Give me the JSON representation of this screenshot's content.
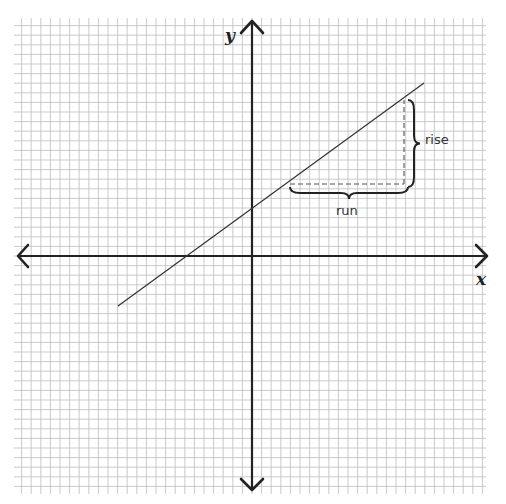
{
  "figure": {
    "title": "",
    "colors": {
      "background": "#ffffff",
      "grid_line": "#bdbdbd",
      "axis": "#222222",
      "line": "#333333",
      "dashed": "#555555",
      "brace": "#222222",
      "text": "#333333"
    },
    "grid": {
      "x_min_px": 14,
      "x_max_px": 486,
      "y_min_px": 18,
      "y_max_px": 494,
      "spacing_px": 9.6
    },
    "axes": {
      "origin_px": [
        252,
        256
      ],
      "x_label": "x",
      "y_label": "y"
    },
    "line": {
      "x1": 118,
      "y1": 306,
      "x2": 424,
      "y2": 83
    },
    "slope_triangle": {
      "run_start": [
        290,
        184
      ],
      "corner": [
        404,
        184
      ],
      "rise_end": [
        404,
        100
      ]
    },
    "annotations": {
      "rise": "rise",
      "run": "run"
    }
  },
  "chart_data": {
    "type": "line",
    "title": "",
    "xlabel": "x",
    "ylabel": "y",
    "grid": true,
    "series": [
      {
        "name": "line",
        "x": [
          -14,
          18
        ],
        "y": [
          -5,
          18
        ]
      }
    ],
    "annotations": [
      "rise",
      "run"
    ]
  }
}
